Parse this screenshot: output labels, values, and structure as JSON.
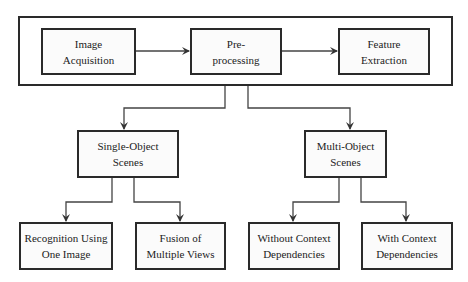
{
  "diagram": {
    "type": "flowchart",
    "pipeline": {
      "nodes": [
        {
          "id": "acq",
          "label": "Image\nAcquisition"
        },
        {
          "id": "pre",
          "label": "Pre-\nprocessing"
        },
        {
          "id": "feat",
          "label": "Feature\nExtraction"
        }
      ]
    },
    "level2": [
      {
        "id": "single",
        "label": "Single-Object\nScenes"
      },
      {
        "id": "multi",
        "label": "Multi-Object\nScenes"
      }
    ],
    "level3": [
      {
        "id": "rec1",
        "label": "Recognition Using\nOne Image",
        "parent": "single"
      },
      {
        "id": "fusion",
        "label": "Fusion of\nMultiple Views",
        "parent": "single"
      },
      {
        "id": "without",
        "label": "Without Context\nDependencies",
        "parent": "multi"
      },
      {
        "id": "with",
        "label": "With Context\nDependencies",
        "parent": "multi"
      }
    ],
    "edges": [
      [
        "acq",
        "pre"
      ],
      [
        "pre",
        "feat"
      ],
      [
        "pipeline",
        "single"
      ],
      [
        "pipeline",
        "multi"
      ],
      [
        "single",
        "rec1"
      ],
      [
        "single",
        "fusion"
      ],
      [
        "multi",
        "without"
      ],
      [
        "multi",
        "with"
      ]
    ]
  }
}
